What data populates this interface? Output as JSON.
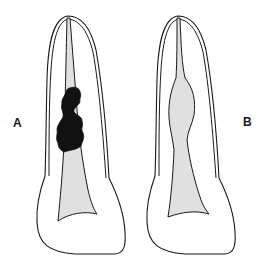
{
  "figure": {
    "panels": [
      {
        "id": "A",
        "label": "A",
        "description": "Tooth with irregular dark obturation mass in root canal"
      },
      {
        "id": "B",
        "label": "B",
        "description": "Tooth with fusiform widening of root canal"
      }
    ],
    "colors": {
      "outline": "#1a1a1a",
      "pulp_fill": "#e0e0e0",
      "mass_fill": "#111111",
      "background": "#ffffff"
    }
  }
}
